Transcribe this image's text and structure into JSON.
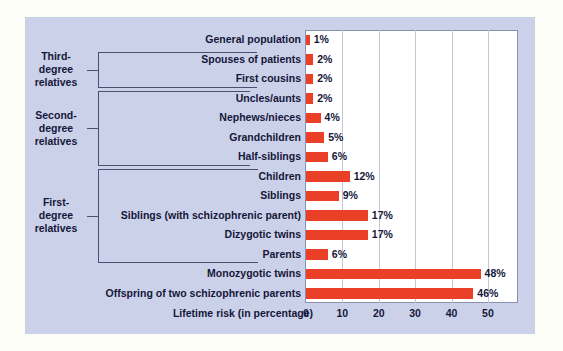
{
  "figure": {
    "background_color": "#cbd1e9",
    "bar_color": "#ea4027",
    "plot_background": "#ffffff"
  },
  "axis_title": "Lifetime risk (in percentage)",
  "group_brackets": [
    {
      "id": "third-degree",
      "label_lines": [
        "Third-",
        "degree",
        "relatives"
      ]
    },
    {
      "id": "second-degree",
      "label_lines": [
        "Second-",
        "degree",
        "relatives"
      ]
    },
    {
      "id": "first-degree",
      "label_lines": [
        "First-",
        "degree",
        "relatives"
      ]
    }
  ],
  "chart_data": {
    "type": "bar",
    "orientation": "horizontal",
    "title": "",
    "xlabel": "Lifetime risk (in percentage)",
    "ylabel": "",
    "xlim": [
      0,
      58
    ],
    "xticks": [
      0,
      10,
      20,
      30,
      40,
      50
    ],
    "xticklabels": [
      "0",
      "10",
      "20",
      "30",
      "40",
      "50"
    ],
    "grid": "vertical",
    "legend": "none",
    "categories": [
      "General population",
      "Spouses of patients",
      "First cousins",
      "Uncles/aunts",
      "Nephews/nieces",
      "Grandchildren",
      "Half-siblings",
      "Children",
      "Siblings",
      "Siblings (with schizophrenic parent)",
      "Dizygotic twins",
      "Parents",
      "Monozygotic twins",
      "Offspring of two schizophrenic parents"
    ],
    "values": [
      1,
      2,
      2,
      2,
      4,
      5,
      6,
      12,
      9,
      17,
      17,
      6,
      48,
      46
    ],
    "data_labels": [
      "1%",
      "2%",
      "2%",
      "2%",
      "4%",
      "5%",
      "6%",
      "12%",
      "9%",
      "17%",
      "17%",
      "6%",
      "48%",
      "46%"
    ],
    "groups": [
      {
        "name": "Third-degree relatives",
        "members": [
          "Spouses of patients",
          "First cousins"
        ]
      },
      {
        "name": "Second-degree relatives",
        "members": [
          "Uncles/aunts",
          "Nephews/nieces",
          "Grandchildren",
          "Half-siblings"
        ]
      },
      {
        "name": "First-degree relatives",
        "members": [
          "Children",
          "Siblings",
          "Siblings (with schizophrenic parent)",
          "Dizygotic twins",
          "Parents"
        ]
      }
    ]
  }
}
